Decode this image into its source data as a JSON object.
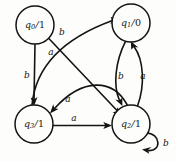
{
  "diagram": {
    "type": "finite-state-machine",
    "background_color": "#fdfdfb",
    "ink_color": "#141414",
    "states": [
      {
        "id": "q0",
        "name": "q",
        "subscript": "0",
        "separator": "/",
        "output": "1",
        "label": "q0/1",
        "cx": 35,
        "cy": 25,
        "r": 19
      },
      {
        "id": "q1",
        "name": "q",
        "subscript": "1",
        "separator": "/",
        "output": "0",
        "label": "q1/0",
        "cx": 131,
        "cy": 23,
        "r": 19
      },
      {
        "id": "q3",
        "name": "q",
        "subscript": "3",
        "separator": "/",
        "output": "1",
        "label": "q3/1",
        "cx": 34,
        "cy": 124,
        "r": 19
      },
      {
        "id": "q2",
        "name": "q",
        "subscript": "2",
        "separator": "/",
        "output": "1",
        "label": "q2/1",
        "cx": 131,
        "cy": 124,
        "r": 19
      }
    ],
    "transitions": [
      {
        "id": "t-q0-q3",
        "from": "q0",
        "to": "q3",
        "input": "b",
        "label_x": 27,
        "label_y": 75
      },
      {
        "id": "t-q0-q2",
        "from": "q0",
        "to": "q2",
        "input": "a",
        "label_x": 51,
        "label_y": 52
      },
      {
        "id": "t-q3-q1",
        "from": "q3",
        "to": "q1",
        "input": "b",
        "label_x": 62,
        "label_y": 32
      },
      {
        "id": "t-q1-q2",
        "from": "q1",
        "to": "q2",
        "input": "b",
        "label_x": 121,
        "label_y": 76
      },
      {
        "id": "t-q2-q1",
        "from": "q2",
        "to": "q1",
        "input": "a",
        "label_x": 143,
        "label_y": 76
      },
      {
        "id": "t-q2-q3",
        "from": "q2",
        "to": "q3",
        "input": "a",
        "label_x": 68,
        "label_y": 99
      },
      {
        "id": "t-q3-q2",
        "from": "q3",
        "to": "q2",
        "input": "a",
        "label_x": 74,
        "label_y": 118
      },
      {
        "id": "t-q2-q2",
        "from": "q2",
        "to": "q2",
        "input": "b",
        "label_x": 166,
        "label_y": 143
      }
    ]
  }
}
